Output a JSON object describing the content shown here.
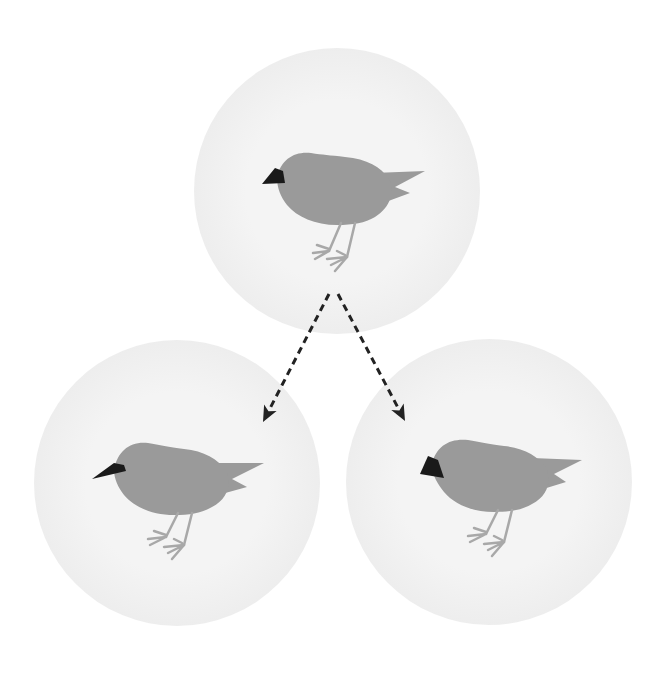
{
  "diagram": {
    "title": "",
    "colors": {
      "background": "#ffffff",
      "circle_fill_center": "#f4f4f4",
      "circle_fill_edge": "#e6e6e6",
      "bird_body": "#9a9a9a",
      "bird_legs": "#a8a8a8",
      "beak": "#1a1a1a",
      "arrow": "#222222"
    },
    "nodes": [
      {
        "id": "ancestor",
        "label": "",
        "cx": 337,
        "cy": 191,
        "r": 143,
        "beak_type": "short-wedge"
      },
      {
        "id": "descendant-left",
        "label": "",
        "cx": 177,
        "cy": 483,
        "r": 143,
        "beak_type": "long-thin"
      },
      {
        "id": "descendant-right",
        "label": "",
        "cx": 489,
        "cy": 482,
        "r": 143,
        "beak_type": "large-thick"
      }
    ],
    "edges": [
      {
        "from": "ancestor",
        "to": "descendant-left",
        "style": "dashed",
        "x1": 329,
        "y1": 294,
        "x2": 263,
        "y2": 422
      },
      {
        "from": "ancestor",
        "to": "descendant-right",
        "style": "dashed",
        "x1": 338,
        "y1": 294,
        "x2": 405,
        "y2": 421
      }
    ]
  }
}
